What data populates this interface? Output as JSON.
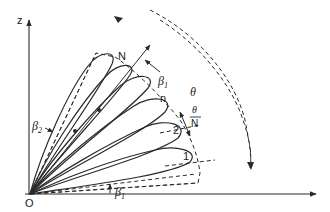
{
  "diagram": {
    "title": "",
    "origin_label": "O",
    "z_axis_label": "z",
    "lobe_labels": {
      "N": "N",
      "n": "n",
      "two": "2",
      "one": "1"
    },
    "angle_labels": {
      "beta1_top": "β",
      "beta1_top_sub": "1",
      "beta1_bottom": "β",
      "beta1_bottom_sub": "1",
      "beta2": "β",
      "beta2_sub": "2",
      "theta": "θ",
      "theta_over_N_num": "θ",
      "theta_over_N_den": "N"
    },
    "colors": {
      "line": "#2a2a2a",
      "background": "#ffffff"
    }
  }
}
